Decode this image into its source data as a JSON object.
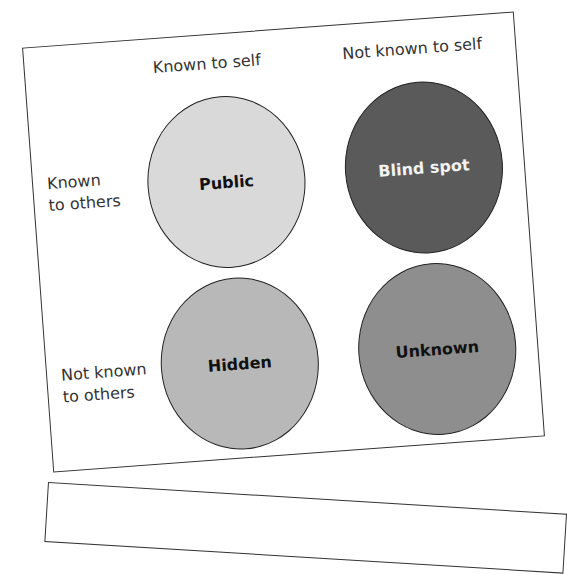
{
  "diagram": {
    "type": "johari-window",
    "column_headers": [
      "Known to self",
      "Not known to self"
    ],
    "row_headers": [
      {
        "line1": "Known",
        "line2": "to others"
      },
      {
        "line1": "Not known",
        "line2": "to others"
      }
    ],
    "quadrants": [
      {
        "label": "Public",
        "fill": "#d9d9d9",
        "text_color": "#111111"
      },
      {
        "label": "Blind spot",
        "fill": "#5a5a5a",
        "text_color": "#f2f2f2"
      },
      {
        "label": "Hidden",
        "fill": "#b8b8b8",
        "text_color": "#111111"
      },
      {
        "label": "Unknown",
        "fill": "#8e8e8e",
        "text_color": "#111111"
      }
    ]
  }
}
